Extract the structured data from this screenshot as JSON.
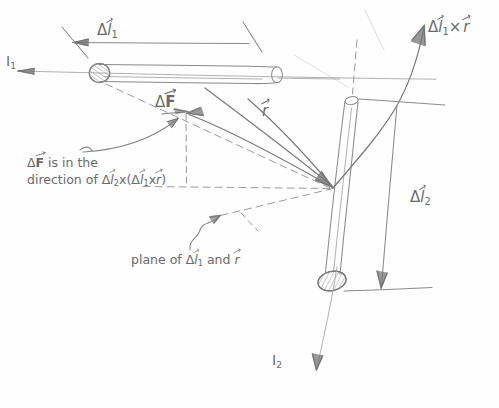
{
  "figure": {
    "ink_color": "#7a7a7a",
    "paper_color": "#fefefe"
  },
  "labels": {
    "delta_l1": {
      "prefix": "Δ",
      "symbol": "l",
      "sub": "1",
      "vector": true,
      "text": "Δl⃗1"
    },
    "delta_l1_cross_r": {
      "text": "Δl⃗1 × r⃗",
      "prefix": "Δ",
      "symbol": "l",
      "sub": "1",
      "operator": "×",
      "second": "r"
    },
    "current_1": {
      "symbol": "I",
      "sub": "1",
      "text": "I1"
    },
    "current_2": {
      "symbol": "I",
      "sub": "2",
      "text": "I2"
    },
    "delta_F": {
      "prefix": "Δ",
      "symbol": "F",
      "vector": true,
      "text": "ΔF⃗"
    },
    "r_vector": {
      "symbol": "r",
      "vector": true,
      "text": "r⃗"
    },
    "delta_l2": {
      "prefix": "Δ",
      "symbol": "l",
      "sub": "2",
      "vector": true,
      "text": "Δl⃗2"
    },
    "note_line1_a": "ΔF",
    "note_line1_b": " is in the",
    "note_line2_a": "direction of ",
    "note_line2_b": "Δl",
    "note_line2_sub1": "2",
    "note_line2_c": "x(",
    "note_line2_d": "Δl",
    "note_line2_sub2": "1",
    "note_line2_e": "x",
    "note_line2_f": "r",
    "note_line2_g": ")",
    "note_full": "ΔF⃗ is in the direction of Δl⃗2 x (Δl⃗1 x r⃗)",
    "plane_a": "plane of ",
    "plane_b": "Δl",
    "plane_sub": "1",
    "plane_c": " and ",
    "plane_d": "r",
    "plane_full": "plane of Δl⃗1 and r⃗"
  },
  "geometry": {
    "rod1": {
      "orientation": "horizontal",
      "x_start": 88,
      "y_start": 73,
      "x_end": 277,
      "y_end": 78
    },
    "rod2": {
      "orientation": "tilted",
      "x_top": 352,
      "y_top": 100,
      "x_bottom": 320,
      "y_bottom": 287
    },
    "field_point": {
      "x": 333,
      "y": 188
    },
    "force_point": {
      "x": 186,
      "y": 113
    }
  }
}
